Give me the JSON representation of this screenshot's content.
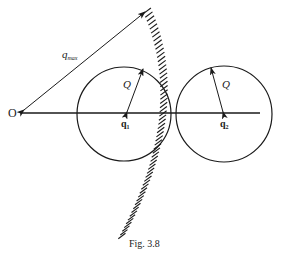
{
  "figure": {
    "caption": "Fig. 3.8",
    "origin_label": "O",
    "qmax_label": "q",
    "qmax_subscript": "max",
    "circle1": {
      "center_label": "q",
      "center_subscript": "1",
      "radius_label": "Q"
    },
    "circle2": {
      "center_label": "q",
      "center_subscript": "2",
      "radius_label": "Q"
    },
    "hatched_surface": "constraint boundary |q| = q_max"
  },
  "colors": {
    "ink": "#1a1a1a",
    "background": "#ffffff"
  }
}
